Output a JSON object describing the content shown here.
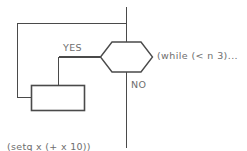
{
  "diagram": {
    "colors": {
      "stroke": "#4a4a4a",
      "shape_fill": "#ffffff",
      "text": "#6e6e6e",
      "background": "#ffffff"
    },
    "decision": {
      "shape": "hexagon",
      "label": "",
      "condition_text": "(while (< n 3)..."
    },
    "branches": {
      "yes_label": "YES",
      "no_label": "NO"
    },
    "process": {
      "shape": "rectangle",
      "label": ""
    },
    "code": {
      "line1": "(setq x (+ x 10))",
      "line2": "(setq n (1+ n))"
    }
  }
}
